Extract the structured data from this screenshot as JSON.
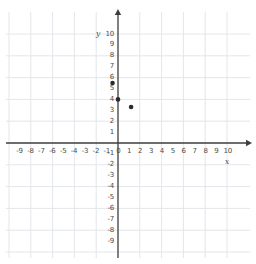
{
  "chart_data": {
    "type": "scatter",
    "title": "",
    "xlabel": "x",
    "ylabel": "y",
    "xlim": [
      -10,
      10.5
    ],
    "ylim": [
      -10,
      10.5
    ],
    "grid": true,
    "grid_step": 2,
    "legend": "none",
    "x_tick_labels": [
      "-9",
      "-8",
      "-7",
      "-6",
      "-5",
      "-4",
      "-3",
      "-2",
      "-1",
      "0",
      "1",
      "2",
      "3",
      "4",
      "5",
      "6",
      "7",
      "8",
      "9",
      "10"
    ],
    "x_tick_values": [
      -9,
      -8,
      -7,
      -6,
      -5,
      -4,
      -3,
      -2,
      -1,
      0,
      1,
      2,
      3,
      4,
      5,
      6,
      7,
      8,
      9,
      10
    ],
    "y_tick_labels": [
      "10",
      "9",
      "8",
      "7",
      "6",
      "5",
      "4",
      "3",
      "2",
      "1",
      "-1",
      "-2",
      "-3",
      "-4",
      "-5",
      "-6",
      "-7",
      "-8",
      "-9"
    ],
    "y_tick_values": [
      10,
      9,
      8,
      7,
      6,
      5,
      4,
      3,
      2,
      1,
      -1,
      -2,
      -3,
      -4,
      -5,
      -6,
      -7,
      -8,
      -9
    ],
    "points": [
      {
        "x": -0.5,
        "y": 5.5
      },
      {
        "x": 0,
        "y": 4
      },
      {
        "x": 1.2,
        "y": 3.3
      }
    ],
    "point_color": "#2b2b2b",
    "axis_color": "#3d3d3d",
    "grid_color": "#e3e6ea",
    "background": "#ffffff"
  }
}
